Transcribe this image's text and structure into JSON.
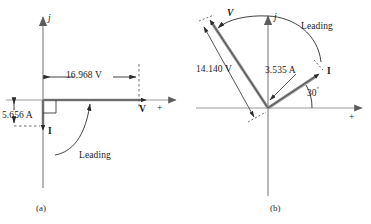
{
  "figure": {
    "title_absent": true,
    "captions": [
      {
        "id": "a",
        "text": "(a)"
      },
      {
        "id": "b",
        "text": "(b)"
      }
    ]
  },
  "panel_a": {
    "caption": "(a)",
    "axis_labels": {
      "vertical": "j",
      "horizontal_vector": "V",
      "horizontal_polarity": "+"
    },
    "annotations": {
      "voltage_dimension": "16.968 V",
      "current_dimension": "5.656 A",
      "current_vector": "I",
      "phase_note": "Leading"
    },
    "geometry": {
      "origin_x": 43,
      "origin_y": 100,
      "v_magnitude_px": 110,
      "i_magnitude_px": 32,
      "right_angle_marker": true
    }
  },
  "panel_b": {
    "caption": "(b)",
    "axis_labels": {
      "vertical": "j",
      "horizontal_polarity": "+"
    },
    "annotations": {
      "voltage_vector": "V",
      "voltage_dimension": "14.140 V",
      "current_vector": "I",
      "current_dimension": "3.535 A",
      "angle": "30",
      "angle_unit": "º",
      "phase_note": "Leading"
    },
    "geometry": {
      "origin_x": 82,
      "origin_y": 108,
      "v_angle_deg": 120,
      "i_angle_deg": 30,
      "v_length_px": 105,
      "i_length_px": 64
    }
  },
  "colors": {
    "vector_fill": "#8e8e8e",
    "vector_edge": "#3c3c3c",
    "axis": "#8a8a8a",
    "annotation": "#2b2b2b",
    "text": "#1c1c1c",
    "background": "#ffffff"
  }
}
